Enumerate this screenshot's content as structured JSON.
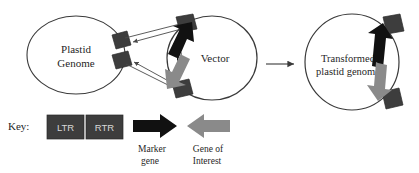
{
  "figure": {
    "type": "diagram",
    "background_color": "#ffffff"
  },
  "colors": {
    "outline": "#3a3a3a",
    "text": "#1f1f1f",
    "flank_box": "#3d3d3d",
    "flank_box_text": "#d8d8d8",
    "marker_gene_arrow": "#111111",
    "gene_of_interest_arrow": "#8a8a8a",
    "recombination_line": "#4a4a4a"
  },
  "circles": {
    "plastid_genome": {
      "label_line1": "Plastid",
      "label_line2": "Genome"
    },
    "vector": {
      "label_line1": "Vector",
      "label_line2": ""
    },
    "transformed": {
      "label_line1": "Transformed",
      "label_line2": "plastid genome"
    }
  },
  "transfer_arrow": {
    "direction": "right",
    "label": ""
  },
  "recombination": {
    "line_count": 4,
    "description": "crossing lines between plastid genome flanks and vector flanks"
  },
  "key": {
    "title": "Key:",
    "boxes": [
      {
        "label": "LTR"
      },
      {
        "label": "RTR"
      }
    ],
    "arrows": [
      {
        "label_line1": "Marker",
        "label_line2": "gene",
        "color_key": "marker_gene_arrow",
        "direction": "right"
      },
      {
        "label_line1": "Gene of",
        "label_line2": "Interest",
        "color_key": "gene_of_interest_arrow",
        "direction": "left"
      }
    ]
  }
}
